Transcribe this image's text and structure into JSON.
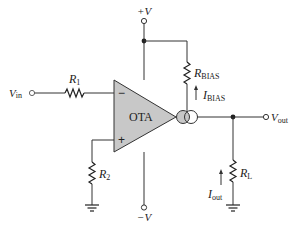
{
  "diagram": {
    "type": "circuit",
    "component": {
      "amplifier": {
        "label": "OTA",
        "inverting_input": "−",
        "noninverting_input": "+"
      },
      "supplies": {
        "positive": "+V",
        "negative": "−V"
      },
      "input": {
        "label_main": "V",
        "label_sub": "in"
      },
      "output": {
        "label_main": "V",
        "label_sub": "out"
      },
      "r1": {
        "label_main": "R",
        "label_sub": "1"
      },
      "r2": {
        "label_main": "R",
        "label_sub": "2"
      },
      "rbias": {
        "label_main": "R",
        "label_sub": "BIAS"
      },
      "ibias": {
        "label_main": "I",
        "label_sub": "BIAS"
      },
      "rl": {
        "label_main": "R",
        "label_sub": "L"
      },
      "iout": {
        "label_main": "I",
        "label_sub": "out"
      }
    },
    "colors": {
      "amplifier_fill": "#c8c8c8",
      "wire": "#333333",
      "background": "#ffffff"
    }
  }
}
